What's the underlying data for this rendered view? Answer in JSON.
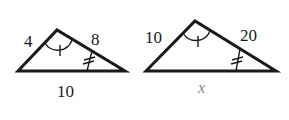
{
  "diagram": {
    "type": "similar-triangles",
    "stroke_color": "#1a1a1a",
    "unknown_color": "#8a8a8a",
    "triangles": [
      {
        "name": "small-triangle",
        "labels": {
          "left_side": "4",
          "right_side": "8",
          "base": "10"
        },
        "marks": {
          "apex_angle": "single-arc-one-tick",
          "right_angle": "double-tick"
        }
      },
      {
        "name": "large-triangle",
        "labels": {
          "left_side": "10",
          "right_side": "20",
          "base": "x"
        },
        "marks": {
          "apex_angle": "single-arc-one-tick",
          "right_angle": "double-tick"
        }
      }
    ]
  }
}
